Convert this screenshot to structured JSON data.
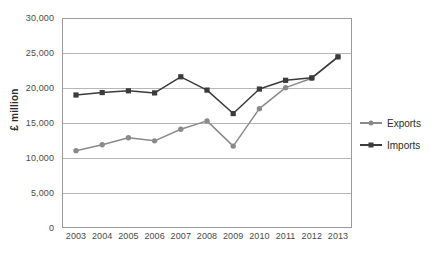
{
  "chart_data": {
    "type": "line",
    "title": "",
    "xlabel": "",
    "ylabel": "£ million",
    "categories": [
      "2003",
      "2004",
      "2005",
      "2006",
      "2007",
      "2008",
      "2009",
      "2010",
      "2011",
      "2012",
      "2013"
    ],
    "x": [
      2003,
      2004,
      2005,
      2006,
      2007,
      2008,
      2009,
      2010,
      2011,
      2012,
      2013
    ],
    "series": [
      {
        "name": "Exports",
        "color": "#8a8a8a",
        "marker": "circle",
        "values": [
          11050,
          11900,
          12900,
          12450,
          14100,
          15300,
          11700,
          17050,
          20050,
          21400,
          24450
        ]
      },
      {
        "name": "Imports",
        "color": "#3b3b3b",
        "marker": "square",
        "values": [
          19000,
          19350,
          19600,
          19300,
          21600,
          19700,
          16350,
          19850,
          21100,
          21450,
          24450
        ]
      }
    ],
    "ylim": [
      0,
      30000
    ],
    "ytick_values": [
      0,
      5000,
      10000,
      15000,
      20000,
      25000,
      30000
    ],
    "ytick_labels": [
      "0",
      "5,000",
      "10,000",
      "15,000",
      "20,000",
      "25,000",
      "30,000"
    ],
    "grid": true,
    "grid_axis": "y",
    "legend_position": "right",
    "legend": [
      {
        "label": "Exports",
        "color": "#8a8a8a",
        "marker": "circle"
      },
      {
        "label": "Imports",
        "color": "#3b3b3b",
        "marker": "square"
      }
    ]
  }
}
